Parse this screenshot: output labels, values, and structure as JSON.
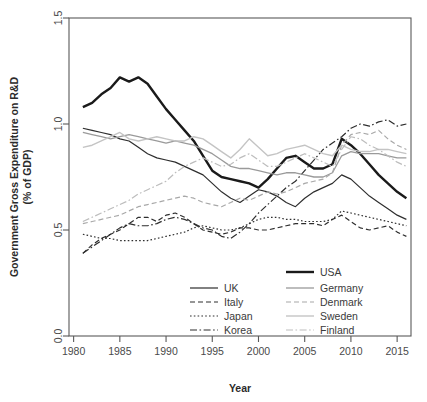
{
  "chart_data": {
    "type": "line",
    "title": "",
    "xlabel": "Year",
    "ylabel": "Government Gross Expenditure on R&D\n(% of GDP)",
    "ylabel_line1": "Government Gross Expenditure on R&D",
    "ylabel_line2": "(% of GDP)",
    "xlim": [
      1979.5,
      2016.5
    ],
    "ylim": [
      0.0,
      1.5
    ],
    "xticks": [
      1980,
      1985,
      1990,
      1995,
      2000,
      2005,
      2010,
      2015
    ],
    "xtick_labels": [
      "1980",
      "1985",
      "1990",
      "1995",
      "2000",
      "2005",
      "2010",
      "2015"
    ],
    "yticks": [
      0.0,
      0.5,
      1.0,
      1.5
    ],
    "ytick_labels": [
      "0.0",
      "0.5",
      "1.0",
      "1.5"
    ],
    "grid": false,
    "legend_position": "bottom-center-inside",
    "x": [
      1981,
      1982,
      1983,
      1984,
      1985,
      1986,
      1987,
      1988,
      1989,
      1990,
      1991,
      1992,
      1993,
      1994,
      1995,
      1996,
      1997,
      1998,
      1999,
      2000,
      2001,
      2002,
      2003,
      2004,
      2005,
      2006,
      2007,
      2008,
      2009,
      2010,
      2011,
      2012,
      2013,
      2014,
      2015,
      2016
    ],
    "series": [
      {
        "name": "USA",
        "color": "#1a1a1a",
        "width": 2.4,
        "dash": "none",
        "values": [
          1.08,
          1.1,
          1.14,
          1.17,
          1.22,
          1.2,
          1.22,
          1.19,
          1.13,
          1.07,
          1.02,
          0.97,
          0.92,
          0.85,
          0.78,
          0.75,
          0.74,
          0.73,
          0.72,
          0.7,
          0.74,
          0.79,
          0.84,
          0.85,
          0.82,
          0.79,
          0.79,
          0.81,
          0.93,
          0.9,
          0.86,
          0.81,
          0.76,
          0.72,
          0.68,
          0.65
        ]
      },
      {
        "name": "UK",
        "color": "#2e2e2e",
        "width": 1.2,
        "dash": "none",
        "values": [
          0.98,
          0.97,
          0.96,
          0.95,
          0.93,
          0.92,
          0.89,
          0.86,
          0.84,
          0.83,
          0.82,
          0.8,
          0.78,
          0.76,
          0.72,
          0.68,
          0.65,
          0.63,
          0.66,
          0.69,
          0.68,
          0.66,
          0.63,
          0.61,
          0.65,
          0.68,
          0.7,
          0.72,
          0.76,
          0.74,
          0.7,
          0.66,
          0.63,
          0.6,
          0.57,
          0.55
        ]
      },
      {
        "name": "Italy",
        "color": "#2e2e2e",
        "width": 1.2,
        "dash": "5,3",
        "values": [
          0.39,
          0.43,
          0.46,
          0.48,
          0.5,
          0.53,
          0.56,
          0.56,
          0.54,
          0.57,
          0.58,
          0.56,
          0.53,
          0.5,
          0.49,
          0.48,
          0.49,
          0.51,
          0.51,
          0.5,
          0.5,
          0.51,
          0.52,
          0.53,
          0.53,
          0.53,
          0.52,
          0.55,
          0.57,
          0.54,
          0.51,
          0.5,
          0.51,
          0.52,
          0.49,
          0.47
        ]
      },
      {
        "name": "Japan",
        "color": "#2e2e2e",
        "width": 1.2,
        "dash": "1.6,2.2",
        "values": [
          0.48,
          0.47,
          0.46,
          0.46,
          0.45,
          0.45,
          0.45,
          0.45,
          0.46,
          0.47,
          0.48,
          0.49,
          0.51,
          0.52,
          0.51,
          0.5,
          0.5,
          0.51,
          0.53,
          0.55,
          0.56,
          0.56,
          0.55,
          0.55,
          0.54,
          0.54,
          0.54,
          0.55,
          0.59,
          0.58,
          0.57,
          0.56,
          0.55,
          0.54,
          0.53,
          0.52
        ]
      },
      {
        "name": "Korea",
        "color": "#2e2e2e",
        "width": 1.2,
        "dash": "7,2.5,1.6,2.5",
        "values": [
          0.39,
          0.42,
          0.45,
          0.48,
          0.51,
          0.53,
          0.52,
          0.52,
          0.53,
          0.55,
          0.56,
          0.55,
          0.53,
          0.51,
          0.5,
          0.47,
          0.46,
          0.49,
          0.53,
          0.58,
          0.62,
          0.66,
          0.7,
          0.73,
          0.78,
          0.83,
          0.88,
          0.91,
          0.94,
          0.98,
          1.0,
          0.99,
          1.01,
          1.02,
          0.99,
          1.0
        ]
      },
      {
        "name": "Germany",
        "color": "#9a9a9a",
        "width": 1.3,
        "dash": "none",
        "values": [
          0.96,
          0.95,
          0.94,
          0.93,
          0.94,
          0.95,
          0.94,
          0.93,
          0.92,
          0.91,
          0.92,
          0.91,
          0.9,
          0.88,
          0.86,
          0.83,
          0.8,
          0.79,
          0.79,
          0.78,
          0.77,
          0.76,
          0.77,
          0.77,
          0.76,
          0.75,
          0.75,
          0.77,
          0.85,
          0.87,
          0.86,
          0.86,
          0.86,
          0.85,
          0.84,
          0.84
        ]
      },
      {
        "name": "Denmark",
        "color": "#a8a8a8",
        "width": 1.2,
        "dash": "5,3",
        "values": [
          0.53,
          0.54,
          0.55,
          0.56,
          0.57,
          0.59,
          0.61,
          0.62,
          0.63,
          0.64,
          0.65,
          0.66,
          0.65,
          0.63,
          0.62,
          0.61,
          0.63,
          0.65,
          0.64,
          0.66,
          0.68,
          0.67,
          0.68,
          0.7,
          0.72,
          0.73,
          0.74,
          0.77,
          0.9,
          0.95,
          0.96,
          0.95,
          0.97,
          0.93,
          0.9,
          0.88
        ]
      },
      {
        "name": "Sweden",
        "color": "#c4c4c4",
        "width": 1.4,
        "dash": "none",
        "values": [
          0.89,
          0.9,
          0.92,
          0.94,
          0.96,
          0.93,
          0.92,
          0.93,
          0.94,
          0.93,
          0.92,
          0.92,
          0.94,
          0.93,
          0.9,
          0.87,
          0.84,
          0.88,
          0.93,
          0.89,
          0.85,
          0.86,
          0.88,
          0.89,
          0.9,
          0.88,
          0.86,
          0.85,
          0.9,
          0.88,
          0.87,
          0.87,
          0.88,
          0.88,
          0.87,
          0.86
        ]
      },
      {
        "name": "Finland",
        "color": "#bdbdbd",
        "width": 1.2,
        "dash": "7,2.5,1.6,2.5",
        "values": [
          0.54,
          0.56,
          0.58,
          0.6,
          0.62,
          0.64,
          0.67,
          0.69,
          0.71,
          0.73,
          0.77,
          0.8,
          0.82,
          0.84,
          0.82,
          0.8,
          0.81,
          0.84,
          0.86,
          0.83,
          0.8,
          0.8,
          0.82,
          0.84,
          0.86,
          0.84,
          0.82,
          0.8,
          0.88,
          0.94,
          0.93,
          0.9,
          0.88,
          0.85,
          0.82,
          0.8
        ]
      }
    ]
  },
  "legend": {
    "top_entry": {
      "label": "USA",
      "key": "USA"
    },
    "left_column": [
      {
        "label": "UK",
        "key": "UK"
      },
      {
        "label": "Italy",
        "key": "Italy"
      },
      {
        "label": "Japan",
        "key": "Japan"
      },
      {
        "label": "Korea",
        "key": "Korea"
      }
    ],
    "right_column": [
      {
        "label": "Germany",
        "key": "Germany"
      },
      {
        "label": "Denmark",
        "key": "Denmark"
      },
      {
        "label": "Sweden",
        "key": "Sweden"
      },
      {
        "label": "Finland",
        "key": "Finland"
      }
    ]
  },
  "axes": {
    "x_title": "Year",
    "y_title_line1": "Government Gross Expenditure on R&D",
    "y_title_line2": "(% of GDP)"
  },
  "colors": {
    "usa": "#1a1a1a",
    "dark": "#2e2e2e",
    "germany": "#9a9a9a",
    "denmark": "#a8a8a8",
    "sweden": "#c4c4c4",
    "finland": "#bdbdbd",
    "axis": "#595959"
  }
}
